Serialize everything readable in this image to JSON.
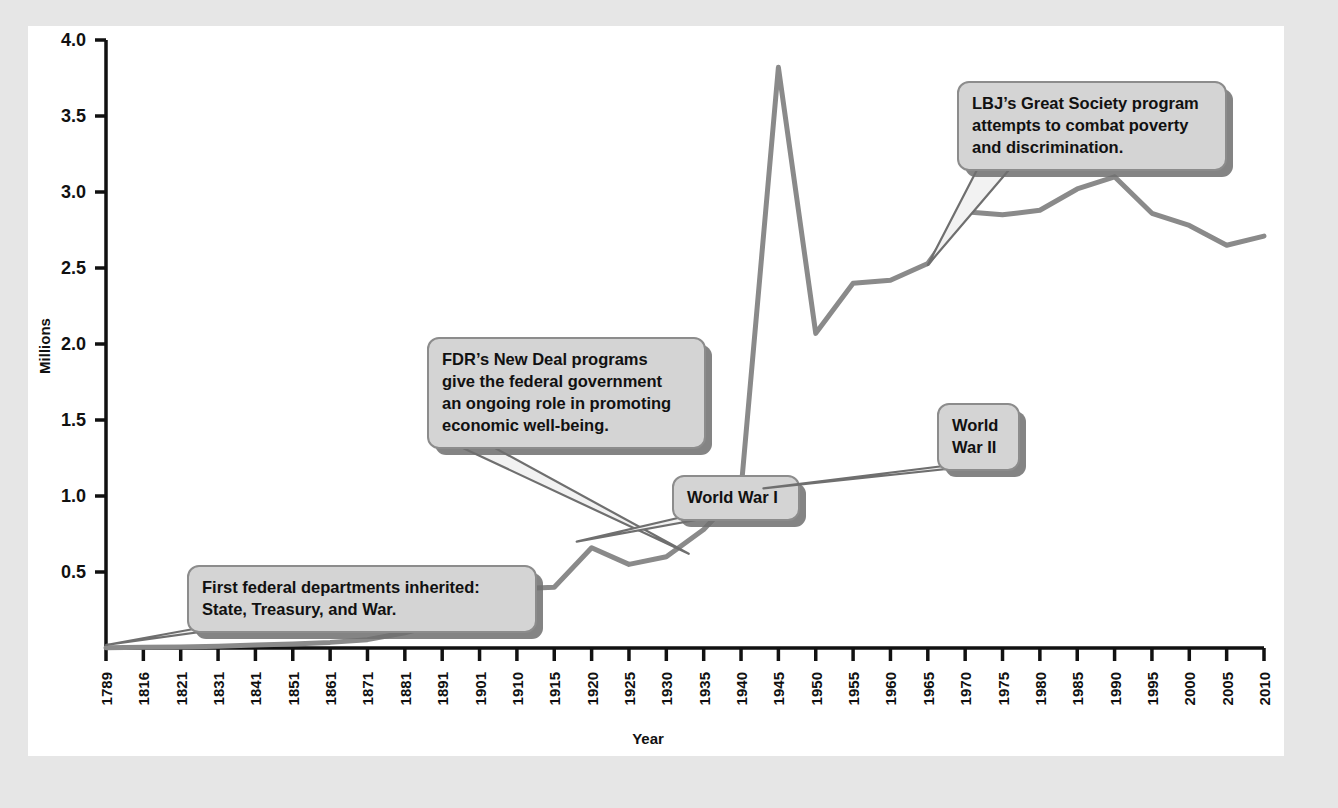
{
  "figure": {
    "background_color": "#e6e6e6",
    "panel_color": "#ffffff",
    "line_color": "#8a8a8a",
    "callout_fill": "#d4d4d4",
    "callout_stroke": "#8c8c8c",
    "callout_shadow": "#6f6f6f",
    "axis_color": "#111111"
  },
  "chart_data": {
    "type": "line",
    "title": "",
    "xlabel": "Year",
    "ylabel": "Millions",
    "ylim": [
      0,
      4.0
    ],
    "grid": false,
    "legend": "none",
    "ytick_labels": [
      "0.5",
      "1.0",
      "1.5",
      "2.0",
      "2.5",
      "3.0",
      "3.5",
      "4.0"
    ],
    "ytick_values": [
      0.5,
      1.0,
      1.5,
      2.0,
      2.5,
      3.0,
      3.5,
      4.0
    ],
    "xtick_labels": [
      "1789",
      "1816",
      "1821",
      "1831",
      "1841",
      "1851",
      "1861",
      "1871",
      "1881",
      "1891",
      "1901",
      "1910",
      "1915",
      "1920",
      "1925",
      "1930",
      "1935",
      "1940",
      "1945",
      "1950",
      "1955",
      "1960",
      "1965",
      "1970",
      "1975",
      "1980",
      "1985",
      "1990",
      "1995",
      "2000",
      "2005",
      "2010"
    ],
    "series": [
      {
        "name": "Federal civilian employees",
        "x": [
          "1789",
          "1816",
          "1821",
          "1831",
          "1841",
          "1851",
          "1861",
          "1871",
          "1881",
          "1891",
          "1901",
          "1910",
          "1915",
          "1920",
          "1925",
          "1930",
          "1935",
          "1940",
          "1945",
          "1950",
          "1955",
          "1960",
          "1965",
          "1970",
          "1975",
          "1980",
          "1985",
          "1990",
          "1995",
          "2000",
          "2005",
          "2010"
        ],
        "values": [
          0.001,
          0.005,
          0.007,
          0.012,
          0.019,
          0.027,
          0.037,
          0.055,
          0.1,
          0.16,
          0.24,
          0.39,
          0.4,
          0.66,
          0.55,
          0.6,
          0.78,
          1.04,
          3.82,
          2.07,
          2.4,
          2.42,
          2.53,
          2.87,
          2.85,
          2.88,
          3.02,
          3.1,
          2.86,
          2.78,
          2.65,
          2.71
        ]
      }
    ],
    "annotations": [
      {
        "id": "first-departments",
        "lines": [
          "First federal departments inherited:",
          "State, Treasury, and War."
        ],
        "target_year": "1789",
        "target_value": 0.02
      },
      {
        "id": "fdr-new-deal",
        "lines": [
          "FDR’s New Deal programs",
          "give the federal government",
          "an ongoing role in promoting",
          "economic well-being."
        ],
        "target_year": "1933",
        "target_value": 0.62
      },
      {
        "id": "world-war-i",
        "lines": [
          "World War I"
        ],
        "target_year": "1918",
        "target_value": 0.7
      },
      {
        "id": "world-war-ii",
        "lines": [
          "World",
          "War II"
        ],
        "target_year": "1943",
        "target_value": 1.05
      },
      {
        "id": "lbj-great-society",
        "lines": [
          "LBJ’s Great Society program",
          "attempts to combat poverty",
          "and discrimination."
        ],
        "target_year": "1965",
        "target_value": 2.52
      }
    ]
  }
}
